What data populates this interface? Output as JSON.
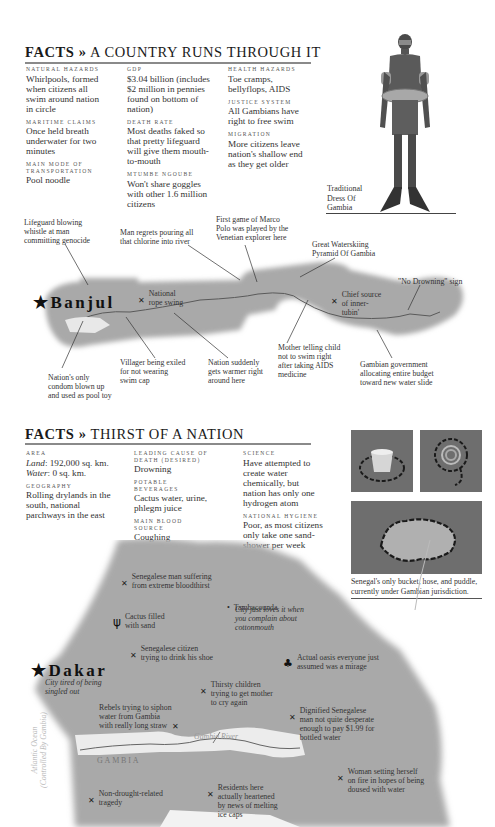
{
  "section1": {
    "title_prefix": "FACTS »",
    "title_rest": "A COUNTRY RUNS THROUGH IT",
    "columns": [
      [
        {
          "label": "Natural Hazards",
          "value": "Whirlpools, formed when citizens all swim around nation in circle"
        },
        {
          "label": "Maritime Claims",
          "value": "Once held breath underwater for two minutes"
        },
        {
          "label": "Main Mode of Transportation",
          "value": "Pool noodle"
        }
      ],
      [
        {
          "label": "GDP",
          "value": "$3.04 billion (includes $2 million in pennies found on bottom of nation)"
        },
        {
          "label": "Death Rate",
          "value": "Most deaths faked so that pretty lifeguard will give them mouth-to-mouth"
        },
        {
          "label": "Mtumbe Ngoube",
          "value": "Won't share goggles with other 1.6 million citizens"
        }
      ],
      [
        {
          "label": "Health Hazards",
          "value": "Toe cramps, bellyflops, AIDS"
        },
        {
          "label": "Justice System",
          "value": "All Gambians have right to free swim"
        },
        {
          "label": "Migration",
          "value": "More citizens leave nation's shallow end as they get older"
        }
      ]
    ],
    "figure_caption": "Traditional\nDress Of\nGambia",
    "map": {
      "capital": "Banjul",
      "annotations": [
        {
          "id": "lifeguard",
          "text": "Lifeguard blowing\nwhistle at man\ncommitting genocide"
        },
        {
          "id": "chlorine",
          "text": "Man regrets pouring all\nthat chlorine into river"
        },
        {
          "id": "marco-polo",
          "text": "First game of Marco\nPolo was played by the\nVenetian explorer here"
        },
        {
          "id": "pyramid",
          "text": "Great Waterskiing\nPyramid Of Gambia"
        },
        {
          "id": "no-drowning",
          "text": "\"No Drowning\" sign"
        },
        {
          "id": "rope-swing",
          "text": "National\nrope swing"
        },
        {
          "id": "inner-tubin",
          "text": "Chief source\nof inner-\ntubin'"
        },
        {
          "id": "condom",
          "text": "Nation's only\ncondom blown up\nand used as pool toy"
        },
        {
          "id": "villager",
          "text": "Villager being exiled\nfor not wearing\nswim cap"
        },
        {
          "id": "warmer",
          "text": "Nation suddenly\ngets warmer right\naround here"
        },
        {
          "id": "mother",
          "text": "Mother telling child\nnot to swim right\nafter taking AIDS\nmedicine"
        },
        {
          "id": "water-slide",
          "text": "Gambian government\nallocating entire budget\ntoward new water slide"
        }
      ]
    }
  },
  "section2": {
    "title_prefix": "FACTS »",
    "title_rest": "THIRST OF A NATION",
    "area": {
      "label": "Area",
      "land_label": "Land",
      "land_value": ": 192,000 sq. km.",
      "water_label": "Water",
      "water_value": ": 0 sq. km."
    },
    "columns": [
      [
        {
          "label": "Geography",
          "value": "Rolling drylands in the south, national parchways in the east"
        }
      ],
      [
        {
          "label": "Leading Cause of Death (Desired)",
          "value": "Drowning"
        },
        {
          "label": "Potable Beverages",
          "value": "Cactus water, urine, phlegm juice"
        },
        {
          "label": "Main Blood Source",
          "value": "Coughing"
        }
      ],
      [
        {
          "label": "Science",
          "value": "Have attempted to create water chemically, but nation has only one hydrogen atom"
        },
        {
          "label": "National Hygiene",
          "value": "Poor, as most citizens only take one sand-shower per week"
        }
      ]
    ],
    "photo_caption": "Senegal's only bucket, hose, and puddle,\ncurrently under Gambian jurisdiction.",
    "map": {
      "capital": "Dakar",
      "capital_note": "City tired of being\nsingled out",
      "city2": "Tambacounda",
      "city2_note": "City just loves it when\nyou complain about\ncottonmouth",
      "river_label": "Gambia River",
      "country_label": "GAMBIA",
      "ocean_label": "Atlantic Ocean\n(Controlled By Gambia)",
      "annotations": [
        {
          "id": "bloodthirst",
          "text": "Senegalese man suffering\nfrom extreme bloodthirst"
        },
        {
          "id": "cactus",
          "text": "Cactus filled\nwith sand"
        },
        {
          "id": "shoe",
          "text": "Senegalese citizen\ntrying to drink his shoe"
        },
        {
          "id": "oasis",
          "text": "Actual oasis everyone just\nassumed was a mirage"
        },
        {
          "id": "children",
          "text": "Thirsty children\ntrying to get mother\nto cry again"
        },
        {
          "id": "rebels",
          "text": "Rebels trying to siphon\nwater from Gambia\nwith really long straw"
        },
        {
          "id": "dignified",
          "text": "Dignified Senegalese\nman not quite desperate\nenough to pay $1.99 for\nbottled water"
        },
        {
          "id": "woman",
          "text": "Woman setting herself\non fire in hopes of being\ndoused with water"
        },
        {
          "id": "tragedy",
          "text": "Non-drought-related\ntragedy"
        },
        {
          "id": "residents",
          "text": "Residents here\nactually heartened\nby news of melting\nice caps"
        }
      ]
    }
  }
}
